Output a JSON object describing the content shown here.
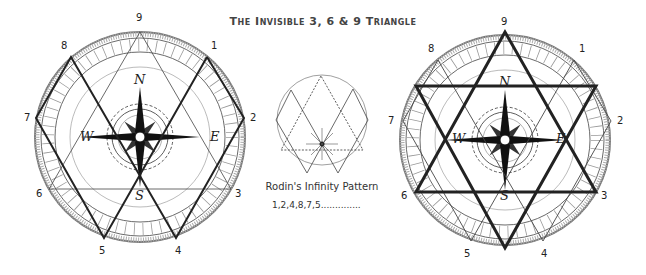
{
  "title": "The Invisible 3, 6 & 9 Triangle",
  "left_compass": {
    "numbers": [
      "9",
      "1",
      "2",
      "3",
      "4",
      "5",
      "6",
      "7",
      "8"
    ],
    "directions": {
      "n": "N",
      "e": "E",
      "s": "S",
      "w": "W"
    },
    "solid_path": "1-2-4-8-7-5",
    "thin_triangle": "9-6-3"
  },
  "center_diagram": {
    "caption": "Rodin's Infinity Pattern",
    "sequence": "1,2,4,8,7,5..............",
    "dotted_triangle": "9-6-3"
  },
  "right_compass": {
    "numbers": [
      "9",
      "1",
      "2",
      "3",
      "4",
      "5",
      "6",
      "7",
      "8"
    ],
    "directions": {
      "n": "N",
      "e": "E",
      "s": "S",
      "w": "W"
    },
    "star": "hexagram"
  },
  "colors": {
    "line": "#222222",
    "ring": "#999999",
    "text": "#333333"
  }
}
